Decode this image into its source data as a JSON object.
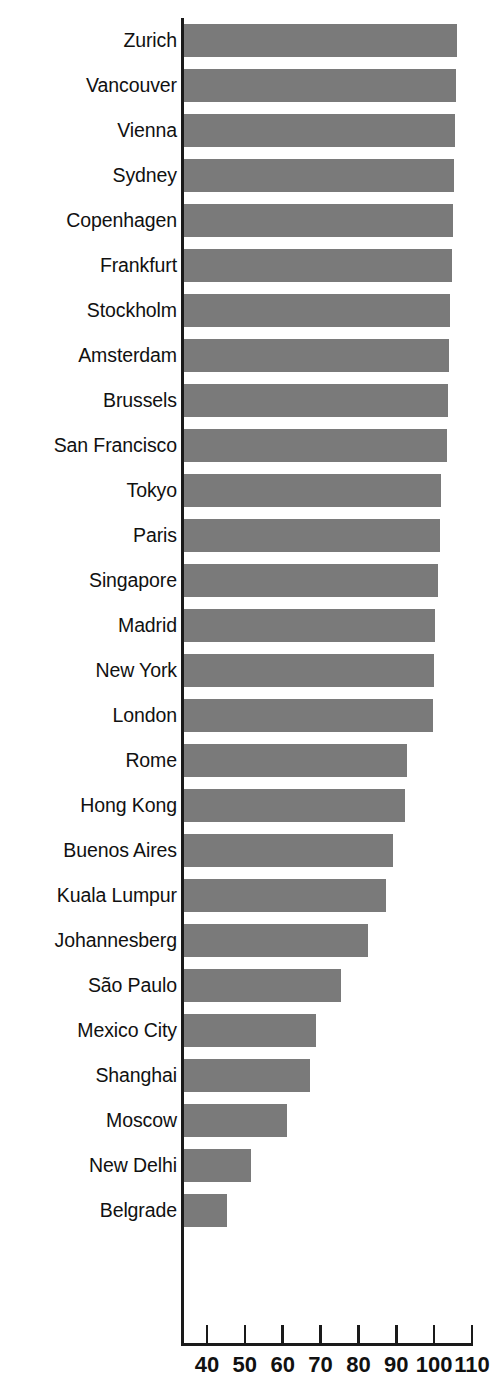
{
  "chart_data": {
    "type": "bar",
    "orientation": "horizontal",
    "title": "",
    "subtitle": "",
    "xlabel": "",
    "ylabel": "",
    "xlim": [
      35.2,
      112.0
    ],
    "axis_start_value": 35.2,
    "grid": false,
    "legend": null,
    "xticks": [
      40,
      50,
      60,
      70,
      80,
      90,
      100,
      110
    ],
    "xtick_labels": [
      "40",
      "50",
      "60",
      "70",
      "80",
      "90",
      "100",
      "110"
    ],
    "categories": [
      "Zurich",
      "Vancouver",
      "Vienna",
      "Sydney",
      "Copenhagen",
      "Frankfurt",
      "Stockholm",
      "Amsterdam",
      "Brussels",
      "San Francisco",
      "Tokyo",
      "Paris",
      "Singapore",
      "Madrid",
      "New York",
      "London",
      "Rome",
      "Hong Kong",
      "Buenos Aires",
      "Kuala Lumpur",
      "Johannesberg",
      "São Paulo",
      "Mexico City",
      "Shanghai",
      "Moscow",
      "New Delhi",
      "Belgrade"
    ],
    "values": [
      106.0,
      105.8,
      105.5,
      105.3,
      105.0,
      104.8,
      104.2,
      104.0,
      103.7,
      103.3,
      101.8,
      101.5,
      101.0,
      100.2,
      100.0,
      99.8,
      92.8,
      92.3,
      89.2,
      87.3,
      82.5,
      75.5,
      68.7,
      67.2,
      61.0,
      51.5,
      45.3
    ],
    "bar_color": "#7a7a7a",
    "background_color": "#ffffff",
    "axis_color": "#1a1a1a"
  }
}
